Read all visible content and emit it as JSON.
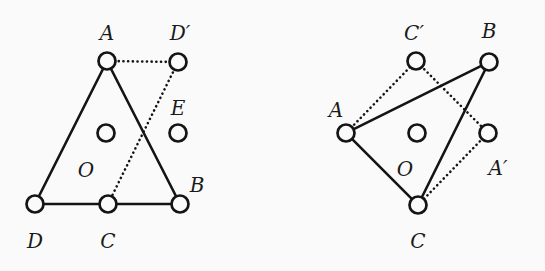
{
  "figure": {
    "caption_present": false,
    "background_color": "#fafafa",
    "ink_color": "#141414",
    "node_radius": 8.5,
    "hole_radius": 8.5,
    "panels": [
      {
        "id": "left-panel",
        "name": "left-diagram",
        "nodes": [
          {
            "id": "L-A",
            "label": "A",
            "x": 107,
            "y": 61,
            "label_x": 107,
            "label_y": 40
          },
          {
            "id": "L-Dp",
            "label": "D′",
            "x": 178,
            "y": 62,
            "label_x": 180,
            "label_y": 40
          },
          {
            "id": "L-D",
            "label": "D",
            "x": 35,
            "y": 204,
            "label_x": 35,
            "label_y": 248
          },
          {
            "id": "L-C",
            "label": "C",
            "x": 108,
            "y": 204,
            "label_x": 108,
            "label_y": 248
          },
          {
            "id": "L-B",
            "label": "B",
            "x": 180,
            "y": 204,
            "label_x": 197,
            "label_y": 192
          }
        ],
        "holes": [
          {
            "id": "L-O",
            "label": "O",
            "x": 106,
            "y": 133,
            "label_x": 86,
            "label_y": 177
          },
          {
            "id": "L-E",
            "label": "E",
            "x": 178,
            "y": 133,
            "label_x": 178,
            "label_y": 115
          }
        ],
        "edges": [
          {
            "from": "L-D",
            "to": "L-A",
            "style": "solid"
          },
          {
            "from": "L-A",
            "to": "L-B",
            "style": "solid"
          },
          {
            "from": "L-D",
            "to": "L-B",
            "style": "solid"
          },
          {
            "from": "L-A",
            "to": "L-Dp",
            "style": "dotted"
          },
          {
            "from": "L-Dp",
            "to": "L-C",
            "style": "dotted"
          }
        ]
      },
      {
        "id": "right-panel",
        "name": "right-diagram",
        "nodes": [
          {
            "id": "R-Cp",
            "label": "C′",
            "x": 416,
            "y": 61,
            "label_x": 414,
            "label_y": 40
          },
          {
            "id": "R-B",
            "label": "B",
            "x": 489,
            "y": 62,
            "label_x": 489,
            "label_y": 38
          },
          {
            "id": "R-A",
            "label": "A",
            "x": 346,
            "y": 133,
            "label_x": 336,
            "label_y": 117
          },
          {
            "id": "R-Ap",
            "label": "A′",
            "x": 488,
            "y": 133,
            "label_x": 498,
            "label_y": 175
          },
          {
            "id": "R-C",
            "label": "C",
            "x": 418,
            "y": 205,
            "label_x": 418,
            "label_y": 248
          }
        ],
        "holes": [
          {
            "id": "R-O",
            "label": "O",
            "x": 417,
            "y": 133,
            "label_x": 405,
            "label_y": 176
          }
        ],
        "edges": [
          {
            "from": "R-A",
            "to": "R-B",
            "style": "solid"
          },
          {
            "from": "R-B",
            "to": "R-C",
            "style": "solid"
          },
          {
            "from": "R-A",
            "to": "R-C",
            "style": "solid"
          },
          {
            "from": "R-A",
            "to": "R-Cp",
            "style": "dotted"
          },
          {
            "from": "R-Cp",
            "to": "R-Ap",
            "style": "dotted"
          },
          {
            "from": "R-Ap",
            "to": "R-C",
            "style": "dotted"
          }
        ]
      }
    ]
  }
}
